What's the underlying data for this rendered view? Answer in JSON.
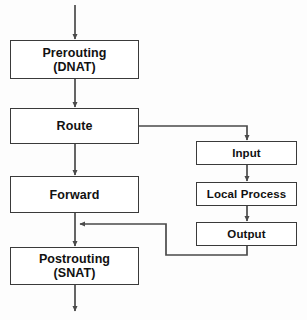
{
  "diagram": {
    "type": "flowchart",
    "orientation": "top-to-bottom",
    "canvas": {
      "width": 307,
      "height": 320
    },
    "style": {
      "background_color": "#fdfdfd",
      "node_fill": "#ffffff",
      "node_border_color": "#3a3a3a",
      "edge_color": "#4a4a4a",
      "text_color": "#111111"
    },
    "nodes": [
      {
        "id": "prerouting",
        "label": "Prerouting\n(DNAT)",
        "line1": "Prerouting",
        "line2": "(DNAT)",
        "column": "left"
      },
      {
        "id": "route",
        "label": "Route",
        "line1": "Route",
        "line2": "",
        "column": "left"
      },
      {
        "id": "forward",
        "label": "Forward",
        "line1": "Forward",
        "line2": "",
        "column": "left"
      },
      {
        "id": "postrouting",
        "label": "Postrouting\n(SNAT)",
        "line1": "Postrouting",
        "line2": "(SNAT)",
        "column": "left"
      },
      {
        "id": "input",
        "label": "Input",
        "line1": "Input",
        "line2": "",
        "column": "right"
      },
      {
        "id": "local_process",
        "label": "Local Process",
        "line1": "Local Process",
        "line2": "",
        "column": "right"
      },
      {
        "id": "output",
        "label": "Output",
        "line1": "Output",
        "line2": "",
        "column": "right"
      }
    ],
    "edges": [
      {
        "id": "e-entry",
        "from": "packet-in",
        "to": "prerouting",
        "label": "",
        "arrow": true
      },
      {
        "id": "e-prerouting-route",
        "from": "prerouting",
        "to": "route",
        "label": "",
        "arrow": true
      },
      {
        "id": "e-route-forward",
        "from": "route",
        "to": "forward",
        "label": "",
        "arrow": true
      },
      {
        "id": "e-route-input",
        "from": "route",
        "to": "input",
        "label": "",
        "arrow": true
      },
      {
        "id": "e-input-local",
        "from": "input",
        "to": "local_process",
        "label": "",
        "arrow": true
      },
      {
        "id": "e-local-output",
        "from": "local_process",
        "to": "output",
        "label": "",
        "arrow": true
      },
      {
        "id": "e-output-postrouting",
        "from": "output",
        "to": "postrouting",
        "label": "",
        "arrow": true
      },
      {
        "id": "e-forward-postrouting",
        "from": "forward",
        "to": "postrouting",
        "label": "",
        "arrow": true
      },
      {
        "id": "e-exit",
        "from": "postrouting",
        "to": "packet-out",
        "label": "",
        "arrow": true
      }
    ]
  }
}
